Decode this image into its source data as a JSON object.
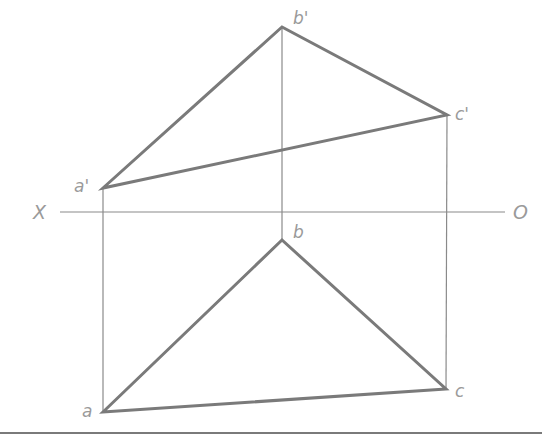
{
  "diagram": {
    "title": "",
    "axis": {
      "left_label": "X",
      "right_label": "O"
    },
    "labels": {
      "a_prime": "a'",
      "b_prime": "b'",
      "c_prime": "c'",
      "a": "a",
      "b": "b",
      "c": "c"
    },
    "points": {
      "a_prime": [
        103,
        188
      ],
      "b_prime": [
        282,
        27
      ],
      "c_prime": [
        447,
        115
      ],
      "a": [
        103,
        412
      ],
      "b": [
        282,
        240
      ],
      "c": [
        446,
        389
      ]
    },
    "axis_y": 212,
    "colors": {
      "line": "#7a7a7a",
      "thin": "#8a8a8a",
      "text": "#9a9a9a"
    }
  }
}
